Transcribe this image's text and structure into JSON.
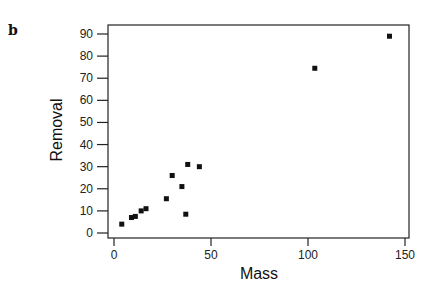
{
  "panel_label": "b",
  "chart_data": {
    "type": "scatter",
    "title": "",
    "xlabel": "Mass",
    "ylabel": "Removal",
    "xlim": [
      -2,
      152
    ],
    "ylim": [
      -2,
      93
    ],
    "xticks": [
      0,
      50,
      100,
      150
    ],
    "yticks": [
      0,
      10,
      20,
      30,
      40,
      50,
      60,
      70,
      80,
      90
    ],
    "grid": false,
    "legend": null,
    "marker": "square",
    "marker_color": "#111111",
    "series": [
      {
        "name": "",
        "points": [
          {
            "x": 4,
            "y": 4
          },
          {
            "x": 9,
            "y": 7
          },
          {
            "x": 11,
            "y": 7.5
          },
          {
            "x": 14,
            "y": 10
          },
          {
            "x": 16.5,
            "y": 11
          },
          {
            "x": 27,
            "y": 15.5
          },
          {
            "x": 30,
            "y": 26
          },
          {
            "x": 35,
            "y": 21
          },
          {
            "x": 37,
            "y": 8.5
          },
          {
            "x": 38,
            "y": 31
          },
          {
            "x": 44,
            "y": 30
          },
          {
            "x": 103.5,
            "y": 74.5
          },
          {
            "x": 142,
            "y": 89
          }
        ]
      }
    ]
  }
}
